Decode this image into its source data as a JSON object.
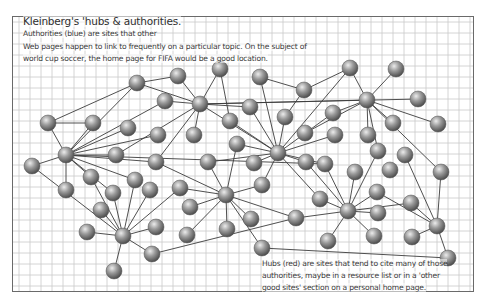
{
  "figure": {
    "title": "Kleinberg's 'hubs & authorities.",
    "intro_lines": [
      "Authorities (blue) are sites that other",
      "Web pages happen to link to frequently on a particular topic. On the subject of",
      "world cup soccer, the home page for FIFA would be a good location."
    ],
    "caption_lines": [
      "Hubs (red) are sites that tend to cite many of those",
      "authorities, maybe in a resource list or in a 'other",
      "good sites' section on a personal home page."
    ]
  },
  "style": {
    "grid_color": "#c9c9c9",
    "edge_color": "#3c3c3c",
    "node_light": "#d8d8d8",
    "node_mid": "#8f8f8f",
    "node_dark": "#4a4a4a",
    "border_color": "#6a6a6a",
    "grid_spacing": 11
  },
  "graph": {
    "node_radius": 8,
    "nodes": [
      {
        "id": 0,
        "x": 137,
        "y": 83
      },
      {
        "id": 1,
        "x": 178,
        "y": 76
      },
      {
        "id": 2,
        "x": 220,
        "y": 69
      },
      {
        "id": 3,
        "x": 260,
        "y": 77
      },
      {
        "id": 4,
        "x": 165,
        "y": 101
      },
      {
        "id": 5,
        "x": 200,
        "y": 104
      },
      {
        "id": 6,
        "x": 250,
        "y": 107
      },
      {
        "id": 7,
        "x": 230,
        "y": 121
      },
      {
        "id": 8,
        "x": 285,
        "y": 117
      },
      {
        "id": 9,
        "x": 304,
        "y": 90
      },
      {
        "id": 10,
        "x": 350,
        "y": 68
      },
      {
        "id": 11,
        "x": 396,
        "y": 69
      },
      {
        "id": 12,
        "x": 367,
        "y": 100
      },
      {
        "id": 13,
        "x": 418,
        "y": 99
      },
      {
        "id": 14,
        "x": 333,
        "y": 113
      },
      {
        "id": 15,
        "x": 393,
        "y": 123
      },
      {
        "id": 16,
        "x": 438,
        "y": 124
      },
      {
        "id": 17,
        "x": 48,
        "y": 123
      },
      {
        "id": 18,
        "x": 93,
        "y": 123
      },
      {
        "id": 19,
        "x": 128,
        "y": 128
      },
      {
        "id": 20,
        "x": 158,
        "y": 135
      },
      {
        "id": 21,
        "x": 194,
        "y": 135
      },
      {
        "id": 22,
        "x": 237,
        "y": 144
      },
      {
        "id": 23,
        "x": 278,
        "y": 153
      },
      {
        "id": 24,
        "x": 305,
        "y": 133
      },
      {
        "id": 25,
        "x": 335,
        "y": 135
      },
      {
        "id": 26,
        "x": 368,
        "y": 135
      },
      {
        "id": 27,
        "x": 66,
        "y": 155
      },
      {
        "id": 28,
        "x": 116,
        "y": 155
      },
      {
        "id": 29,
        "x": 32,
        "y": 166
      },
      {
        "id": 30,
        "x": 156,
        "y": 162
      },
      {
        "id": 31,
        "x": 208,
        "y": 162
      },
      {
        "id": 32,
        "x": 254,
        "y": 163
      },
      {
        "id": 33,
        "x": 306,
        "y": 162
      },
      {
        "id": 34,
        "x": 378,
        "y": 151
      },
      {
        "id": 35,
        "x": 405,
        "y": 155
      },
      {
        "id": 36,
        "x": 325,
        "y": 164
      },
      {
        "id": 37,
        "x": 355,
        "y": 172
      },
      {
        "id": 38,
        "x": 390,
        "y": 170
      },
      {
        "id": 39,
        "x": 441,
        "y": 172
      },
      {
        "id": 40,
        "x": 91,
        "y": 177
      },
      {
        "id": 41,
        "x": 135,
        "y": 180
      },
      {
        "id": 42,
        "x": 180,
        "y": 188
      },
      {
        "id": 43,
        "x": 262,
        "y": 185
      },
      {
        "id": 44,
        "x": 66,
        "y": 190
      },
      {
        "id": 45,
        "x": 113,
        "y": 193
      },
      {
        "id": 46,
        "x": 150,
        "y": 190
      },
      {
        "id": 47,
        "x": 226,
        "y": 195
      },
      {
        "id": 48,
        "x": 320,
        "y": 199
      },
      {
        "id": 49,
        "x": 377,
        "y": 192
      },
      {
        "id": 50,
        "x": 101,
        "y": 210
      },
      {
        "id": 51,
        "x": 190,
        "y": 207
      },
      {
        "id": 52,
        "x": 251,
        "y": 219
      },
      {
        "id": 53,
        "x": 296,
        "y": 218
      },
      {
        "id": 54,
        "x": 348,
        "y": 211
      },
      {
        "id": 55,
        "x": 378,
        "y": 213
      },
      {
        "id": 56,
        "x": 411,
        "y": 203
      },
      {
        "id": 57,
        "x": 437,
        "y": 226
      },
      {
        "id": 58,
        "x": 87,
        "y": 232
      },
      {
        "id": 59,
        "x": 123,
        "y": 236
      },
      {
        "id": 60,
        "x": 156,
        "y": 227
      },
      {
        "id": 61,
        "x": 187,
        "y": 235
      },
      {
        "id": 62,
        "x": 227,
        "y": 229
      },
      {
        "id": 63,
        "x": 262,
        "y": 248
      },
      {
        "id": 64,
        "x": 328,
        "y": 241
      },
      {
        "id": 65,
        "x": 374,
        "y": 236
      },
      {
        "id": 66,
        "x": 412,
        "y": 237
      },
      {
        "id": 67,
        "x": 152,
        "y": 254
      },
      {
        "id": 68,
        "x": 448,
        "y": 258
      },
      {
        "id": 69,
        "x": 114,
        "y": 271
      }
    ],
    "edges": [
      [
        17,
        0
      ],
      [
        17,
        18
      ],
      [
        17,
        27
      ],
      [
        18,
        27
      ],
      [
        0,
        27
      ],
      [
        0,
        5
      ],
      [
        0,
        1
      ],
      [
        27,
        28
      ],
      [
        27,
        29
      ],
      [
        27,
        19
      ],
      [
        27,
        4
      ],
      [
        27,
        20
      ],
      [
        27,
        30
      ],
      [
        27,
        40
      ],
      [
        27,
        44
      ],
      [
        27,
        45
      ],
      [
        27,
        41
      ],
      [
        27,
        36
      ],
      [
        29,
        59
      ],
      [
        5,
        1
      ],
      [
        5,
        2
      ],
      [
        5,
        4
      ],
      [
        5,
        6
      ],
      [
        5,
        12
      ],
      [
        5,
        13
      ],
      [
        5,
        21
      ],
      [
        5,
        30
      ],
      [
        5,
        23
      ],
      [
        5,
        28
      ],
      [
        2,
        7
      ],
      [
        3,
        9
      ],
      [
        23,
        6
      ],
      [
        23,
        7
      ],
      [
        23,
        3
      ],
      [
        23,
        8
      ],
      [
        23,
        22
      ],
      [
        23,
        14
      ],
      [
        23,
        10
      ],
      [
        23,
        31
      ],
      [
        23,
        32
      ],
      [
        23,
        33
      ],
      [
        23,
        43
      ],
      [
        23,
        25
      ],
      [
        23,
        36
      ],
      [
        23,
        48
      ],
      [
        12,
        10
      ],
      [
        12,
        11
      ],
      [
        12,
        14
      ],
      [
        12,
        15
      ],
      [
        12,
        16
      ],
      [
        12,
        24
      ],
      [
        12,
        26
      ],
      [
        12,
        34
      ],
      [
        12,
        39
      ],
      [
        8,
        9
      ],
      [
        9,
        10
      ],
      [
        47,
        42
      ],
      [
        47,
        31
      ],
      [
        47,
        30
      ],
      [
        47,
        22
      ],
      [
        47,
        51
      ],
      [
        47,
        52
      ],
      [
        47,
        62
      ],
      [
        47,
        43
      ],
      [
        47,
        61
      ],
      [
        47,
        53
      ],
      [
        47,
        63
      ],
      [
        59,
        40
      ],
      [
        59,
        41
      ],
      [
        59,
        45
      ],
      [
        59,
        46
      ],
      [
        59,
        50
      ],
      [
        59,
        58
      ],
      [
        59,
        60
      ],
      [
        59,
        67
      ],
      [
        59,
        69
      ],
      [
        59,
        42
      ],
      [
        67,
        53
      ],
      [
        54,
        48
      ],
      [
        54,
        37
      ],
      [
        54,
        49
      ],
      [
        54,
        55
      ],
      [
        54,
        64
      ],
      [
        54,
        65
      ],
      [
        54,
        36
      ],
      [
        54,
        33
      ],
      [
        54,
        53
      ],
      [
        54,
        56
      ],
      [
        54,
        34
      ],
      [
        57,
        56
      ],
      [
        57,
        39
      ],
      [
        57,
        66
      ],
      [
        57,
        68
      ],
      [
        57,
        35
      ],
      [
        57,
        49
      ],
      [
        63,
        68
      ]
    ]
  }
}
